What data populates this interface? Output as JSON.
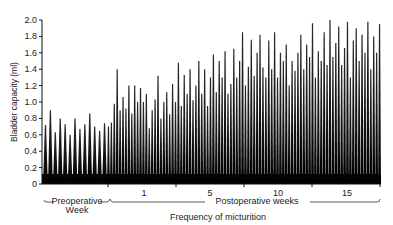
{
  "chart_data": {
    "type": "bar",
    "subtype": "spike-trace",
    "title": "",
    "ylabel": "Bladder capacity (ml)",
    "xlabel": "Frequency of micturition",
    "ylim": [
      0,
      2.0
    ],
    "yticks": [
      "0",
      "0.2",
      "0.4",
      "0.6",
      "0.8",
      "1.0",
      "1.2",
      "1.4",
      "1.6",
      "1.8",
      "2.0"
    ],
    "xticks": [
      "1",
      "5",
      "10",
      "15"
    ],
    "groups": [
      {
        "name": "Preoperative Week",
        "label_line1": "Preoperative",
        "label_line2": "Week"
      },
      {
        "name": "Postoperative weeks",
        "label_line1": "Postoperative weeks"
      }
    ],
    "series": [
      {
        "name": "Preoperative",
        "values": [
          0.72,
          0.9,
          0.63,
          0.8,
          0.73,
          0.6,
          0.8,
          0.67,
          0.73,
          0.86,
          0.7,
          0.65,
          0.74
        ]
      },
      {
        "name": "Postoperative",
        "values": [
          0.7,
          0.75,
          0.98,
          1.4,
          0.9,
          1.06,
          0.92,
          1.2,
          0.86,
          1.2,
          1.0,
          1.17,
          1.0,
          1.1,
          0.68,
          0.9,
          1.03,
          1.32,
          0.8,
          1.0,
          1.12,
          0.85,
          1.22,
          1.0,
          1.48,
          0.95,
          1.33,
          1.1,
          1.4,
          1.02,
          1.2,
          1.5,
          1.1,
          1.4,
          0.95,
          1.3,
          1.58,
          1.12,
          1.5,
          1.3,
          1.62,
          1.1,
          1.22,
          1.65,
          1.3,
          1.5,
          1.85,
          1.2,
          1.43,
          1.76,
          1.32,
          1.6,
          1.82,
          1.42,
          1.3,
          1.75,
          1.4,
          1.85,
          1.3,
          1.6,
          1.5,
          1.7,
          1.2,
          1.5,
          1.38,
          1.6,
          1.82,
          1.4,
          1.7,
          1.55,
          1.96,
          1.3,
          1.62,
          1.5,
          1.85,
          1.45,
          2.0,
          1.55,
          1.72,
          1.92,
          1.45,
          1.66,
          1.98,
          1.3,
          1.75,
          1.9,
          1.5,
          1.82,
          1.6,
          1.98,
          1.4,
          1.8,
          1.6,
          1.95
        ]
      }
    ]
  }
}
